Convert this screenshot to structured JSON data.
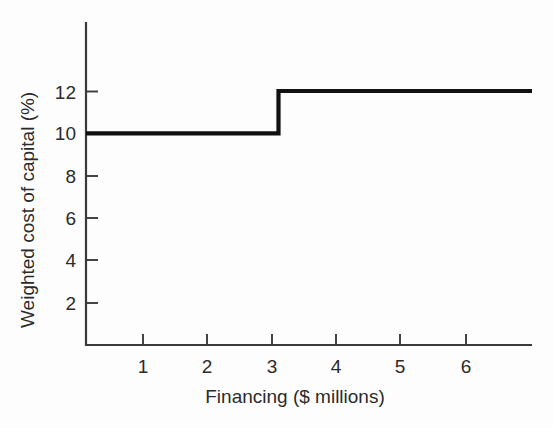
{
  "chart_data": {
    "type": "line",
    "subtype": "step-post",
    "title": "",
    "xlabel": "Financing ($ millions)",
    "ylabel": "Weighted cost of capital (%)",
    "xlim": [
      0,
      6.95
    ],
    "ylim": [
      0,
      13.4
    ],
    "xticks": [
      1,
      2,
      3,
      4,
      5,
      6
    ],
    "xtick_labels": [
      "1",
      "2",
      "3",
      "4",
      "5",
      "6"
    ],
    "yticks": [
      2,
      4,
      6,
      8,
      10,
      12
    ],
    "ytick_labels": [
      "2",
      "4",
      "6",
      "8",
      "10",
      "12"
    ],
    "grid": false,
    "legend": null,
    "series": [
      {
        "name": "Weighted marginal cost of capital",
        "color": "#111111",
        "points": [
          {
            "x": 0.0,
            "y": 10
          },
          {
            "x": 3.0,
            "y": 10
          },
          {
            "x": 3.0,
            "y": 12
          },
          {
            "x": 6.95,
            "y": 12
          }
        ],
        "steps": [
          {
            "x_start": 0.0,
            "x_end": 3.0,
            "y": 10
          },
          {
            "x_start": 3.0,
            "x_end": 6.95,
            "y": 12
          }
        ],
        "break_point_x": 3.0,
        "break_point_label": ""
      }
    ],
    "annotations": []
  },
  "axes": {
    "y_axis_title": "Weighted cost of capital (%)",
    "x_axis_title": "Financing ($ millions)",
    "y_tick_values": [
      "12",
      "10",
      "8",
      "6",
      "4",
      "2"
    ],
    "x_tick_values": [
      "1",
      "2",
      "3",
      "4",
      "5",
      "6"
    ],
    "axis_color": "#3a3a3a",
    "line_color": "#111111",
    "background_color": "#fdfdfd"
  }
}
